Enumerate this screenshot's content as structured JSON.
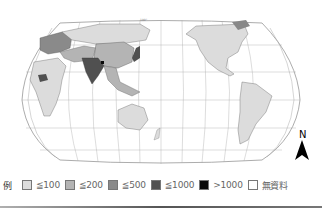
{
  "map": {
    "projection": "Pacific-centered world map",
    "graticule_color": "#9a9a9a",
    "outline_color": "#888888",
    "regions": [
      {
        "name": "north-america",
        "category": 1
      },
      {
        "name": "south-america",
        "category": 1
      },
      {
        "name": "africa",
        "category": 1
      },
      {
        "name": "europe",
        "category": 2
      },
      {
        "name": "russia",
        "category": 1
      },
      {
        "name": "china",
        "category": 2
      },
      {
        "name": "india",
        "category": 3
      },
      {
        "name": "bangladesh",
        "category": 4
      },
      {
        "name": "japan",
        "category": 3
      },
      {
        "name": "southeast-asia",
        "category": 2
      },
      {
        "name": "australia",
        "category": 1
      },
      {
        "name": "greenland",
        "category": 5
      }
    ]
  },
  "north_arrow": {
    "label": "N"
  },
  "legend": {
    "title": "例",
    "items": [
      {
        "label": "≦100",
        "color": "#dcdcdc"
      },
      {
        "label": "≦200",
        "color": "#b4b4b4"
      },
      {
        "label": "≦500",
        "color": "#8a8a8a"
      },
      {
        "label": "≦1000",
        "color": "#505050"
      },
      {
        "label": ">1000",
        "color": "#0a0a0a"
      },
      {
        "label": "無資料",
        "color": "#ffffff"
      }
    ]
  }
}
